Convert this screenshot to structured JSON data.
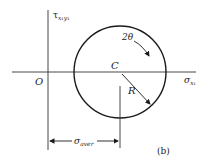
{
  "diagram": {
    "type": "mohr-circle",
    "panel_label": "(b)",
    "axes": {
      "vertical": {
        "symbol": "τ",
        "subscript": "x₁y₁"
      },
      "horizontal": {
        "symbol": "σ",
        "subscript": "x₁"
      },
      "origin": "O"
    },
    "circle": {
      "center_label": "C",
      "radius_label": "R",
      "angle_label": "2θ"
    },
    "dimension": {
      "symbol": "σ",
      "subscript": "aver"
    },
    "colors": {
      "line": "#1a1a1a",
      "axis": "#333333",
      "background": "#ffffff"
    }
  }
}
